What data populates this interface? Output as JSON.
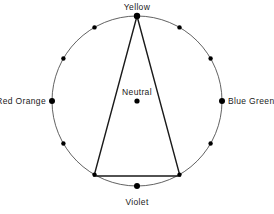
{
  "diagram": {
    "type": "color-wheel-harmony",
    "title": "",
    "background_color": "#ffffff",
    "stroke_color": "#3a3a3a",
    "triangle_stroke_color": "#1a1a1a",
    "dot_color": "#000000",
    "text_color": "#1a1a1a",
    "circle": {
      "center_x": 137,
      "center_y": 101,
      "radius": 85,
      "stroke_width": 0.8
    },
    "center_point": {
      "label": "Neutral",
      "x": 137,
      "y": 101,
      "dot_radius": 2.6
    },
    "hue_points": [
      {
        "label": "Yellow",
        "angle_deg": 270,
        "x": 137.0,
        "y": 16.0,
        "labeled": true,
        "dot_radius": 3.2
      },
      {
        "label": "",
        "angle_deg": 300,
        "x": 179.5,
        "y": 27.4,
        "labeled": false,
        "dot_radius": 2.2
      },
      {
        "label": "",
        "angle_deg": 330,
        "x": 210.6,
        "y": 58.5,
        "labeled": false,
        "dot_radius": 2.2
      },
      {
        "label": "Blue Green",
        "angle_deg": 0,
        "x": 222.0,
        "y": 101.0,
        "labeled": true,
        "dot_radius": 3.0
      },
      {
        "label": "",
        "angle_deg": 30,
        "x": 210.6,
        "y": 143.5,
        "labeled": false,
        "dot_radius": 2.2
      },
      {
        "label": "",
        "angle_deg": 60,
        "x": 179.5,
        "y": 174.6,
        "labeled": false,
        "dot_radius": 2.2
      },
      {
        "label": "Violet",
        "angle_deg": 90,
        "x": 137.0,
        "y": 186.0,
        "labeled": true,
        "dot_radius": 3.0
      },
      {
        "label": "",
        "angle_deg": 120,
        "x": 94.5,
        "y": 174.6,
        "labeled": false,
        "dot_radius": 2.2
      },
      {
        "label": "",
        "angle_deg": 150,
        "x": 63.4,
        "y": 143.5,
        "labeled": false,
        "dot_radius": 2.2
      },
      {
        "label": "Red Orange",
        "angle_deg": 180,
        "x": 52.0,
        "y": 101.0,
        "labeled": true,
        "dot_radius": 3.0
      },
      {
        "label": "",
        "angle_deg": 210,
        "x": 63.4,
        "y": 58.5,
        "labeled": false,
        "dot_radius": 2.2
      },
      {
        "label": "",
        "angle_deg": 240,
        "x": 94.5,
        "y": 27.4,
        "labeled": false,
        "dot_radius": 2.2
      }
    ],
    "triangle": {
      "name": "split-complementary-triangle",
      "stroke_width": 1.4,
      "vertices": [
        {
          "name": "apex-yellow",
          "x": 137.0,
          "y": 16.0
        },
        {
          "name": "lower-right-vertex",
          "x": 180.0,
          "y": 176.0
        },
        {
          "name": "lower-left-vertex",
          "x": 94.0,
          "y": 176.0
        }
      ],
      "points_attr": "137,16 180,176 94,176"
    },
    "labels": {
      "yellow": "Yellow",
      "violet": "Violet",
      "red_orange": "Red Orange",
      "blue_green": "Blue Green",
      "neutral": "Neutral"
    }
  }
}
